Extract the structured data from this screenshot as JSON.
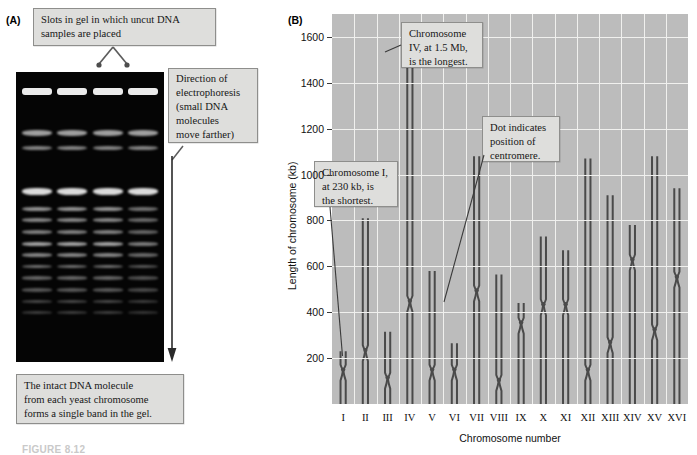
{
  "figure": {
    "caption_partial": "FIGURE 8.12"
  },
  "panel_a": {
    "tag": "(A)",
    "callout_slots": "Slots in gel in which uncut DNA samples are placed",
    "callout_direction": "Direction of electrophoresis (small DNA molecules move farther)",
    "callout_direction_lines": [
      "Direction of",
      "electrophoresis",
      "(small DNA",
      "molecules",
      "move farther)"
    ],
    "callout_bottom": "The intact DNA molecule from each yeast chromosome forms a single band in the gel.",
    "callout_bottom_lines": [
      "The intact DNA molecule",
      "from each yeast chromosome",
      "forms a single band in the gel."
    ],
    "gel": {
      "lanes": 4,
      "description": "Pulsed-field gel electrophoresis of yeast chromosomal DNA",
      "band_rows_brightness": [
        1.0,
        0.72,
        0.6,
        0.95,
        0.66,
        0.6,
        0.58,
        0.72,
        0.6,
        0.5,
        0.45,
        0.38,
        0.3,
        0.24
      ]
    }
  },
  "panel_b": {
    "tag": "(B)",
    "callout_shortest_lines": [
      "Chromosome I,",
      "at 230 kb, is",
      "the shortest."
    ],
    "callout_longest_lines": [
      "Chromosome",
      "IV, at 1.5 Mb,",
      "is the longest."
    ],
    "callout_centromere_lines": [
      "Dot indicates",
      "position of",
      "centromere."
    ]
  },
  "chart_data": {
    "type": "bar",
    "title": "",
    "xlabel": "Chromosome number",
    "ylabel": "Length of chromosome (kb)",
    "ylim": [
      0,
      1700
    ],
    "yticks": [
      200,
      400,
      600,
      800,
      1000,
      1200,
      1400,
      1600
    ],
    "grid": true,
    "legend": "none",
    "categories": [
      "I",
      "II",
      "III",
      "IV",
      "V",
      "VI",
      "VII",
      "VIII",
      "IX",
      "X",
      "XI",
      "XII",
      "XIII",
      "XIV",
      "XV",
      "XVI"
    ],
    "values": [
      230,
      810,
      315,
      1530,
      580,
      265,
      1080,
      565,
      440,
      730,
      670,
      1070,
      910,
      780,
      1080,
      940
    ],
    "centromere_kb": [
      150,
      235,
      115,
      450,
      150,
      150,
      495,
      105,
      355,
      435,
      435,
      150,
      270,
      630,
      325,
      555
    ],
    "annotations": [
      {
        "target": "I",
        "text": "Chromosome I, at 230 kb, is the shortest."
      },
      {
        "target": "IV",
        "text": "Chromosome IV, at 1.5 Mb, is the longest."
      },
      {
        "target": "VIII",
        "text": "Dot indicates position of centromere."
      }
    ]
  }
}
